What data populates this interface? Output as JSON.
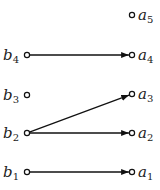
{
  "diagram": {
    "type": "bipartite-mapping",
    "left_nodes": [
      {
        "id": "b4",
        "base": "b",
        "sub": "4",
        "x": 27,
        "y": 55
      },
      {
        "id": "b3",
        "base": "b",
        "sub": "3",
        "x": 27,
        "y": 95
      },
      {
        "id": "b2",
        "base": "b",
        "sub": "2",
        "x": 27,
        "y": 133
      },
      {
        "id": "b1",
        "base": "b",
        "sub": "1",
        "x": 27,
        "y": 172
      }
    ],
    "right_nodes": [
      {
        "id": "a5",
        "base": "a",
        "sub": "5",
        "x": 132,
        "y": 15
      },
      {
        "id": "a4",
        "base": "a",
        "sub": "4",
        "x": 132,
        "y": 55
      },
      {
        "id": "a3",
        "base": "a",
        "sub": "3",
        "x": 132,
        "y": 94
      },
      {
        "id": "a2",
        "base": "a",
        "sub": "2",
        "x": 132,
        "y": 133
      },
      {
        "id": "a1",
        "base": "a",
        "sub": "1",
        "x": 132,
        "y": 172
      }
    ],
    "edges": [
      {
        "from": "b4",
        "to": "a4"
      },
      {
        "from": "b2",
        "to": "a3"
      },
      {
        "from": "b2",
        "to": "a2"
      },
      {
        "from": "b1",
        "to": "a1"
      }
    ],
    "colors": {
      "stroke": "#111111",
      "background": "#ffffff"
    }
  }
}
